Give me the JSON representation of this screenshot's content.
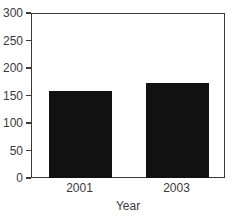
{
  "chart_data": {
    "type": "bar",
    "title": "",
    "xlabel": "Year",
    "ylabel": "",
    "categories": [
      "2001",
      "2003"
    ],
    "values": [
      160,
      175
    ],
    "ylim": [
      0,
      300
    ],
    "yticks": [
      0,
      50,
      100,
      150,
      200,
      250,
      300
    ],
    "ytick_labels": [
      "0",
      "50",
      "100",
      "150",
      "200",
      "250",
      "300"
    ],
    "grid": false,
    "legend": null,
    "bar_color": "#111111",
    "axis_color": "#3a3a3a",
    "background": "#ffffff"
  },
  "axes": {
    "y": {
      "ticks": [
        {
          "label": "300",
          "value": 300
        },
        {
          "label": "250",
          "value": 250
        },
        {
          "label": "200",
          "value": 200
        },
        {
          "label": "150",
          "value": 150
        },
        {
          "label": "100",
          "value": 100
        },
        {
          "label": "50",
          "value": 50
        },
        {
          "label": "0",
          "value": 0
        }
      ]
    },
    "x": {
      "title": "Year",
      "ticks": [
        {
          "label": "2001"
        },
        {
          "label": "2003"
        }
      ]
    }
  }
}
